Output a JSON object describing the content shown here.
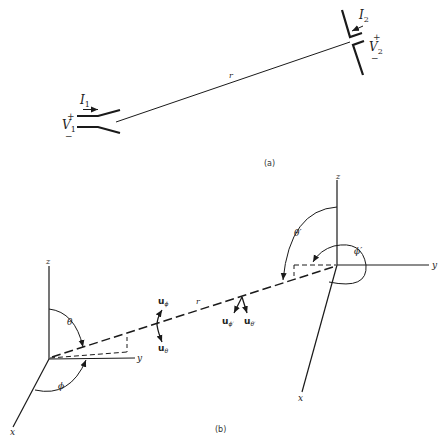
{
  "figure": {
    "part_a": {
      "caption": "(a)",
      "antenna1": {
        "current_label": "I",
        "current_sub": "1",
        "voltage_label": "V",
        "voltage_sub": "1",
        "plus": "+",
        "minus": "−"
      },
      "antenna2": {
        "current_label": "I",
        "current_sub": "2",
        "voltage_label": "V",
        "voltage_sub": "2",
        "plus": "+",
        "minus": "−"
      },
      "distance_label": "r"
    },
    "part_b": {
      "caption": "(b)",
      "left_frame": {
        "z": "z",
        "y": "y",
        "x": "x",
        "theta": "θ",
        "phi": "ϕ"
      },
      "right_frame": {
        "z": "z",
        "y": "y",
        "x": "x",
        "theta": "θ′",
        "phi": "ϕ′"
      },
      "distance_label": "r",
      "unit_vectors_left": {
        "u_phi": "u",
        "u_phi_sub": "ϕ",
        "u_theta": "u",
        "u_theta_sub": "θ"
      },
      "unit_vectors_right": {
        "u_phi": "u",
        "u_phi_sub": "ϕ′",
        "u_theta": "u",
        "u_theta_sub": "θ′"
      }
    }
  },
  "colors": {
    "ink": "#1a1a1a",
    "background": "#ffffff"
  }
}
